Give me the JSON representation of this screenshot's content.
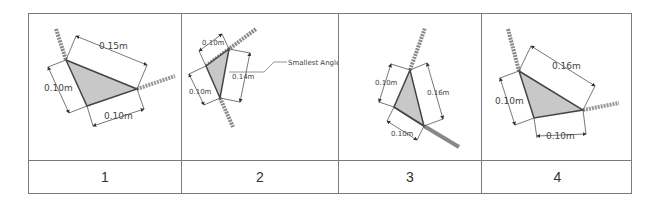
{
  "figures": [
    {
      "id": "1",
      "labels": {
        "top": "0.15m",
        "left": "0.10m",
        "bottom": "0.10m"
      }
    },
    {
      "id": "2",
      "labels": {
        "top": "0.10m",
        "left": "0.10m",
        "right": "0.14m",
        "callout": "Smallest Angle"
      }
    },
    {
      "id": "3",
      "labels": {
        "left": "0.10m",
        "right": "0.16m",
        "bottom": "0.10m"
      }
    },
    {
      "id": "4",
      "labels": {
        "top": "0.16m",
        "left": "0.10m",
        "bottom": "0.10m"
      }
    }
  ],
  "colors": {
    "border": "#7a7a7a",
    "fill": "#c8c8c8",
    "line": "#555555"
  }
}
